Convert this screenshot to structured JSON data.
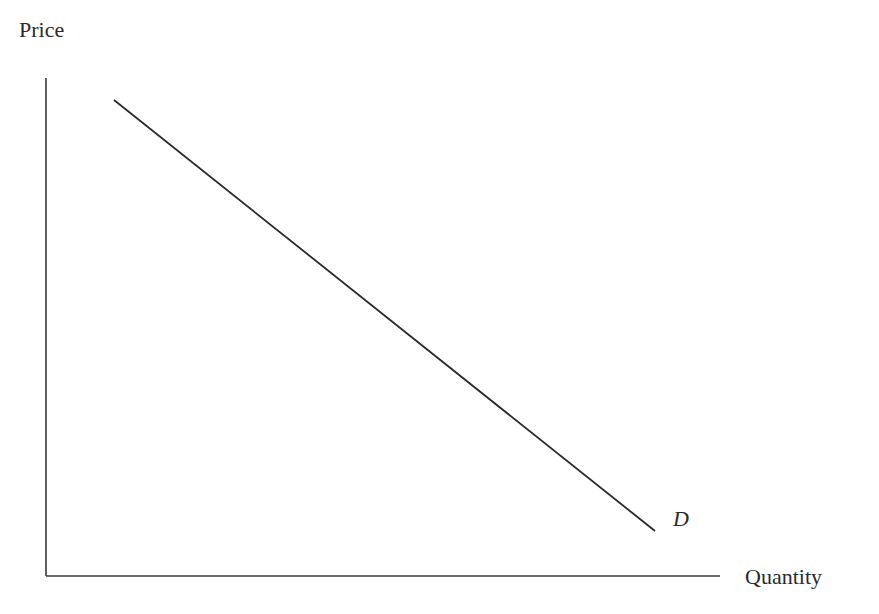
{
  "chart_data": {
    "type": "line",
    "title": "",
    "xlabel": "Quantity",
    "ylabel": "Price",
    "grid": false,
    "legend": null,
    "ticks": {
      "x": [],
      "y": []
    },
    "series": [
      {
        "name": "D",
        "description": "Downward-sloping linear demand curve",
        "points": [
          {
            "x": 0.1,
            "y": 0.96
          },
          {
            "x": 0.91,
            "y": 0.09
          }
        ]
      }
    ],
    "annotations": [
      {
        "text": "D",
        "italic": true,
        "near": "lower-right end of demand curve"
      }
    ],
    "xlim": [
      0,
      1
    ],
    "ylim": [
      0,
      1
    ],
    "colors": {
      "line": "#2a2a2a",
      "axis": "#3a3a3a",
      "background": "#ffffff"
    },
    "geometry": {
      "origin": {
        "x": 46,
        "y": 576
      },
      "y_axis_top": 78,
      "x_axis_right": 720,
      "curve_start": {
        "x": 114,
        "y": 100
      },
      "curve_end": {
        "x": 655,
        "y": 531
      }
    }
  },
  "labels": {
    "y_axis": "Price",
    "x_axis": "Quantity",
    "curve": "D"
  }
}
